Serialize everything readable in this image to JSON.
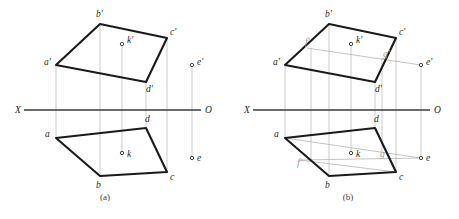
{
  "page": {
    "background": "#ffffff",
    "width": 459,
    "height": 219
  },
  "styles": {
    "outline_color": "#1a1a1a",
    "projector_color": "#b6b6b6",
    "construction_color": "#a9a9a9",
    "axis_color": "#3b3b3b",
    "label_color": "#231f20",
    "label_light_color": "#9a9a9a"
  },
  "figures": [
    {
      "id": "figure-a",
      "caption": "(a)",
      "caption_pos": {
        "x": 105,
        "y": 200
      },
      "axis": {
        "label_left": "X",
        "label_right": "O",
        "label_left_pos": {
          "x": 15,
          "y": 113
        },
        "label_right_pos": {
          "x": 205,
          "y": 113
        },
        "x1": 24,
        "x2": 201,
        "y": 110
      },
      "front_view": {
        "name": "frontal-projection",
        "points": [
          {
            "id": "a-prime",
            "label": "a'",
            "x": 56,
            "y": 65,
            "label_x": 44,
            "label_y": 65
          },
          {
            "id": "b-prime",
            "label": "b'",
            "x": 100,
            "y": 24,
            "label_x": 96,
            "label_y": 17
          },
          {
            "id": "c-prime",
            "label": "c'",
            "x": 167,
            "y": 38,
            "label_x": 170,
            "label_y": 35
          },
          {
            "id": "d-prime",
            "label": "d'",
            "x": 146,
            "y": 82,
            "label_x": 146,
            "label_y": 92
          }
        ],
        "polygon": "56,65 100,24 167,38 146,82"
      },
      "top_view": {
        "name": "horizontal-projection",
        "points": [
          {
            "id": "a",
            "label": "a",
            "x": 56,
            "y": 138,
            "label_x": 45,
            "label_y": 137
          },
          {
            "id": "b",
            "label": "b",
            "x": 100,
            "y": 176,
            "label_x": 96,
            "label_y": 188
          },
          {
            "id": "c",
            "label": "c",
            "x": 167,
            "y": 172,
            "label_x": 170,
            "label_y": 180
          },
          {
            "id": "d",
            "label": "d",
            "x": 146,
            "y": 128,
            "label_x": 145,
            "label_y": 122
          }
        ],
        "polygon": "56,138 100,176 167,172 146,128"
      },
      "free_points": [
        {
          "id": "k-prime",
          "label": "k'",
          "x": 122,
          "y": 44,
          "label_x": 127,
          "label_y": 43
        },
        {
          "id": "k",
          "label": "k",
          "x": 122,
          "y": 153,
          "label_x": 127,
          "label_y": 157
        },
        {
          "id": "e-prime",
          "label": "e'",
          "x": 192,
          "y": 65,
          "label_x": 197,
          "label_y": 65
        },
        {
          "id": "e",
          "label": "e",
          "x": 192,
          "y": 158,
          "label_x": 197,
          "label_y": 161
        }
      ],
      "projectors": [
        {
          "x": 56,
          "y1": 65,
          "y2": 138
        },
        {
          "x": 100,
          "y1": 24,
          "y2": 176
        },
        {
          "x": 122,
          "y1": 44,
          "y2": 153
        },
        {
          "x": 146,
          "y1": 82,
          "y2": 128
        },
        {
          "x": 167,
          "y1": 38,
          "y2": 172
        },
        {
          "x": 192,
          "y1": 65,
          "y2": 158
        }
      ]
    },
    {
      "id": "figure-b",
      "caption": "(b)",
      "caption_pos": {
        "x": 348,
        "y": 200
      },
      "axis": {
        "label_left": "X",
        "label_right": "O",
        "label_left_pos": {
          "x": 244,
          "y": 113
        },
        "label_right_pos": {
          "x": 434,
          "y": 113
        },
        "x1": 253,
        "x2": 430,
        "y": 110
      },
      "front_view": {
        "name": "frontal-projection",
        "points": [
          {
            "id": "a-prime",
            "label": "a'",
            "x": 285,
            "y": 65,
            "label_x": 273,
            "label_y": 65
          },
          {
            "id": "b-prime",
            "label": "b'",
            "x": 329,
            "y": 24,
            "label_x": 325,
            "label_y": 17
          },
          {
            "id": "c-prime",
            "label": "c'",
            "x": 396,
            "y": 38,
            "label_x": 399,
            "label_y": 35
          },
          {
            "id": "d-prime",
            "label": "d'",
            "x": 375,
            "y": 82,
            "label_x": 375,
            "label_y": 92
          }
        ],
        "polygon": "285,65 329,24 396,38 375,82"
      },
      "top_view": {
        "name": "horizontal-projection",
        "points": [
          {
            "id": "a",
            "label": "a",
            "x": 285,
            "y": 138,
            "label_x": 274,
            "label_y": 137
          },
          {
            "id": "b",
            "label": "b",
            "x": 329,
            "y": 176,
            "label_x": 325,
            "label_y": 188
          },
          {
            "id": "c",
            "label": "c",
            "x": 396,
            "y": 172,
            "label_x": 399,
            "label_y": 180
          },
          {
            "id": "d",
            "label": "d",
            "x": 375,
            "y": 128,
            "label_x": 374,
            "label_y": 122
          }
        ],
        "polygon": "285,138 329,176 396,172 375,128"
      },
      "free_points": [
        {
          "id": "k-prime",
          "label": "k'",
          "x": 351,
          "y": 44,
          "label_x": 356,
          "label_y": 43
        },
        {
          "id": "k",
          "label": "k",
          "x": 351,
          "y": 153,
          "label_x": 356,
          "label_y": 157
        },
        {
          "id": "e-prime",
          "label": "e'",
          "x": 421,
          "y": 65,
          "label_x": 426,
          "label_y": 65
        },
        {
          "id": "e",
          "label": "e",
          "x": 421,
          "y": 158,
          "label_x": 426,
          "label_y": 161
        }
      ],
      "projectors": [
        {
          "x": 285,
          "y1": 65,
          "y2": 138
        },
        {
          "x": 329,
          "y1": 24,
          "y2": 176
        },
        {
          "x": 351,
          "y1": 44,
          "y2": 153
        },
        {
          "x": 375,
          "y1": 82,
          "y2": 128
        },
        {
          "x": 396,
          "y1": 38,
          "y2": 172
        },
        {
          "x": 421,
          "y1": 65,
          "y2": 158
        },
        {
          "x": 311,
          "y1": 48,
          "y2": 160
        },
        {
          "x": 382,
          "y1": 58,
          "y2": 152
        }
      ],
      "construction_points": [
        {
          "id": "f-prime",
          "label": "f'",
          "x": 311,
          "y": 48,
          "label_x": 305,
          "label_y": 45
        },
        {
          "id": "g-prime",
          "label": "g'",
          "x": 382,
          "y": 58,
          "label_x": 383,
          "label_y": 57
        },
        {
          "id": "f",
          "label": "f",
          "x": 302,
          "y": 160,
          "label_x": 297,
          "label_y": 166
        },
        {
          "id": "g",
          "label": "g",
          "x": 382,
          "y": 152,
          "label_x": 380,
          "label_y": 157
        }
      ],
      "construction_lines": [
        {
          "id": "front-horizontal-fg",
          "x1": 307,
          "y1": 48,
          "x2": 421,
          "y2": 65
        },
        {
          "id": "top-line-a-to-e",
          "x1": 285,
          "y1": 138,
          "x2": 421,
          "y2": 158
        },
        {
          "id": "top-line-f-to-e",
          "x1": 299,
          "y1": 160,
          "x2": 421,
          "y2": 158
        },
        {
          "id": "top-diagonal-f-c",
          "x1": 299,
          "y1": 160,
          "x2": 396,
          "y2": 172
        }
      ]
    }
  ]
}
